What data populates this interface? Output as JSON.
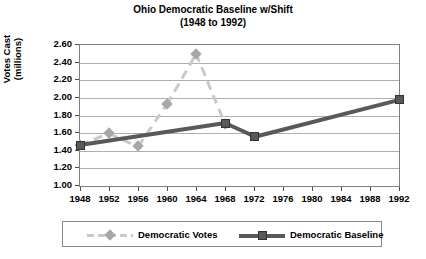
{
  "chart_data": {
    "type": "line",
    "title": "Ohio Democratic Baseline w/Shift",
    "subtitle": "(1948 to 1992)",
    "xlabel": "",
    "ylabel": "Votes Cast",
    "ylabel_unit": "(millions)",
    "grid": true,
    "legend_position": "bottom",
    "ylim": [
      1.0,
      2.6
    ],
    "ytick_step": 0.2,
    "categories": [
      1948,
      1952,
      1956,
      1960,
      1964,
      1968,
      1972,
      1976,
      1980,
      1984,
      1988,
      1992
    ],
    "xtick_labels": [
      "1948",
      "1952",
      "1956",
      "1960",
      "1964",
      "1968",
      "1972",
      "1976",
      "1980",
      "1984",
      "1988",
      "1992"
    ],
    "ytick_labels": [
      "1.00",
      "1.20",
      "1.40",
      "1.60",
      "1.80",
      "2.00",
      "2.20",
      "2.40",
      "2.60"
    ],
    "ytick_values": [
      1.0,
      1.2,
      1.4,
      1.6,
      1.8,
      2.0,
      2.2,
      2.4,
      2.6
    ],
    "series": [
      {
        "name": "Democratic Votes",
        "color": "#c9c9c9",
        "marker": "diamond",
        "style": "dashed",
        "x": [
          1948,
          1952,
          1956,
          1960,
          1964,
          1968
        ],
        "values": [
          1.46,
          1.6,
          1.45,
          1.93,
          2.5,
          1.7
        ]
      },
      {
        "name": "Democratic Baseline",
        "color": "#595959",
        "marker": "square",
        "style": "solid",
        "x": [
          1948,
          1968,
          1972,
          1992
        ],
        "values": [
          1.46,
          1.71,
          1.56,
          1.98
        ]
      }
    ]
  },
  "legend": {
    "entries": [
      {
        "label": "Democratic Votes"
      },
      {
        "label": "Democratic Baseline"
      }
    ]
  }
}
